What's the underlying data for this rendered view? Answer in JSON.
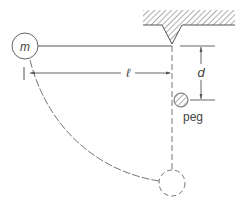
{
  "diagram": {
    "type": "pendulum-with-peg",
    "labels": {
      "mass": "m",
      "length": "ℓ",
      "peg_distance": "d",
      "peg": "peg"
    },
    "colors": {
      "line": "#555555",
      "hatch": "#777777",
      "background": "#ffffff"
    }
  }
}
